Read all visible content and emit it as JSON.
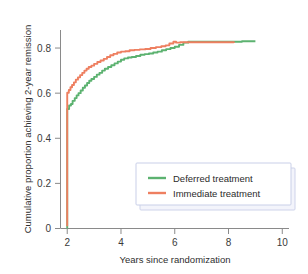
{
  "chart_data": {
    "type": "line",
    "title": "",
    "xlabel": "Years since randomization",
    "ylabel": "Cumulative proportion achieving 2-year remission",
    "xlim": [
      1.75,
      10.25
    ],
    "ylim": [
      0,
      0.88
    ],
    "xticks": [
      2,
      4,
      6,
      8,
      10
    ],
    "xticklabels": [
      "2",
      "4",
      "6",
      "8",
      "10"
    ],
    "yticks": [
      0,
      0.2,
      0.4,
      0.6,
      0.8
    ],
    "yticklabels": [
      "0",
      "0.2",
      "0.4",
      "0.6",
      "0.8"
    ],
    "grid": false,
    "legend_position": "lower right",
    "colors": {
      "deferred": "#5cb270",
      "immediate": "#ee7f60",
      "axis": "#8a8a8a",
      "text": "#2b2b2b",
      "legend_border": "#c9cfe8",
      "legend_shadow": "#e8eaf6"
    },
    "series": [
      {
        "name": "Deferred treatment",
        "color": "#5cb270",
        "points": [
          [
            2.0,
            0.0
          ],
          [
            2.0,
            0.53
          ],
          [
            2.07,
            0.545
          ],
          [
            2.14,
            0.552
          ],
          [
            2.2,
            0.566
          ],
          [
            2.28,
            0.578
          ],
          [
            2.35,
            0.59
          ],
          [
            2.42,
            0.6
          ],
          [
            2.5,
            0.612
          ],
          [
            2.58,
            0.624
          ],
          [
            2.66,
            0.634
          ],
          [
            2.74,
            0.645
          ],
          [
            2.82,
            0.655
          ],
          [
            2.9,
            0.663
          ],
          [
            3.0,
            0.672
          ],
          [
            3.1,
            0.682
          ],
          [
            3.2,
            0.69
          ],
          [
            3.3,
            0.7
          ],
          [
            3.4,
            0.708
          ],
          [
            3.52,
            0.716
          ],
          [
            3.64,
            0.724
          ],
          [
            3.76,
            0.732
          ],
          [
            3.88,
            0.74
          ],
          [
            4.0,
            0.748
          ],
          [
            4.12,
            0.754
          ],
          [
            4.26,
            0.758
          ],
          [
            4.4,
            0.76
          ],
          [
            4.56,
            0.765
          ],
          [
            4.72,
            0.77
          ],
          [
            4.88,
            0.773
          ],
          [
            5.04,
            0.776
          ],
          [
            5.2,
            0.78
          ],
          [
            5.36,
            0.784
          ],
          [
            5.52,
            0.79
          ],
          [
            5.68,
            0.795
          ],
          [
            5.84,
            0.8
          ],
          [
            6.0,
            0.806
          ],
          [
            6.16,
            0.814
          ],
          [
            6.32,
            0.824
          ],
          [
            6.5,
            0.828
          ],
          [
            7.0,
            0.828
          ],
          [
            7.5,
            0.828
          ],
          [
            8.0,
            0.828
          ],
          [
            8.5,
            0.83
          ],
          [
            9.0,
            0.83
          ]
        ]
      },
      {
        "name": "Immediate treatment",
        "color": "#ee7f60",
        "points": [
          [
            2.0,
            0.01
          ],
          [
            2.0,
            0.602
          ],
          [
            2.06,
            0.614
          ],
          [
            2.12,
            0.626
          ],
          [
            2.18,
            0.636
          ],
          [
            2.25,
            0.648
          ],
          [
            2.32,
            0.66
          ],
          [
            2.4,
            0.67
          ],
          [
            2.48,
            0.68
          ],
          [
            2.56,
            0.69
          ],
          [
            2.64,
            0.7
          ],
          [
            2.72,
            0.708
          ],
          [
            2.8,
            0.716
          ],
          [
            2.9,
            0.722
          ],
          [
            3.0,
            0.73
          ],
          [
            3.12,
            0.738
          ],
          [
            3.24,
            0.745
          ],
          [
            3.36,
            0.752
          ],
          [
            3.48,
            0.76
          ],
          [
            3.6,
            0.768
          ],
          [
            3.72,
            0.774
          ],
          [
            3.86,
            0.78
          ],
          [
            4.0,
            0.784
          ],
          [
            4.16,
            0.786
          ],
          [
            4.32,
            0.79
          ],
          [
            4.5,
            0.792
          ],
          [
            4.7,
            0.794
          ],
          [
            4.9,
            0.796
          ],
          [
            5.1,
            0.8
          ],
          [
            5.3,
            0.804
          ],
          [
            5.5,
            0.808
          ],
          [
            5.66,
            0.812
          ],
          [
            5.8,
            0.82
          ],
          [
            5.95,
            0.828
          ],
          [
            6.05,
            0.824
          ],
          [
            6.2,
            0.826
          ],
          [
            6.4,
            0.826
          ],
          [
            7.0,
            0.826
          ],
          [
            7.6,
            0.826
          ],
          [
            8.2,
            0.822
          ]
        ]
      }
    ]
  },
  "legend": {
    "entries": [
      {
        "label": "Deferred treatment",
        "color": "#5cb270"
      },
      {
        "label": "Immediate treatment",
        "color": "#ee7f60"
      }
    ]
  }
}
